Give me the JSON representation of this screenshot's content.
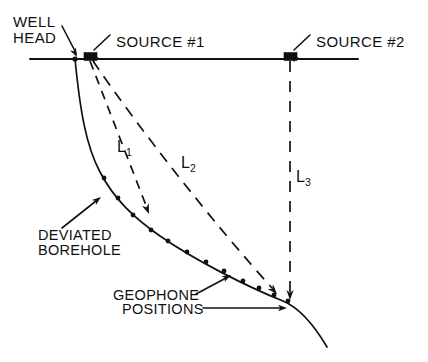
{
  "figure": {
    "background_color": "#ffffff",
    "line_color": "#111111",
    "labels": {
      "well_head_line1": "WELL",
      "well_head_line2": "HEAD",
      "source_1": "SOURCE #1",
      "source_2": "SOURCE #2",
      "deviated_line1": "DEVIATED",
      "deviated_line2": "BOREHOLE",
      "geophone_line1": "GEOPHONE",
      "geophone_line2": "POSITIONS"
    },
    "ray_labels": [
      {
        "base": "L",
        "sub": "1"
      },
      {
        "base": "L",
        "sub": "2"
      },
      {
        "base": "L",
        "sub": "3"
      }
    ],
    "surface": {
      "name": "ground-surface-line",
      "x1": 30,
      "y1": 59,
      "x2": 358,
      "y2": 59
    },
    "well_head_marker": {
      "x": 75,
      "y": 59,
      "r": 2.6
    },
    "sources": [
      {
        "name": "source-1",
        "x": 84,
        "y": 52.5,
        "w": 13,
        "h": 8
      },
      {
        "name": "source-2",
        "x": 284,
        "y": 52.5,
        "w": 13,
        "h": 8
      }
    ],
    "borehole_path": "M 75,59 C 80,110 86,146 100,172 C 114,199 134,218 160,236 C 196,261 248,287 283,301 C 300,308 314,325 327,347",
    "geophones": [
      {
        "x": 104,
        "y": 178
      },
      {
        "x": 118,
        "y": 198
      },
      {
        "x": 133,
        "y": 215
      },
      {
        "x": 151,
        "y": 230
      },
      {
        "x": 168,
        "y": 241
      },
      {
        "x": 187,
        "y": 252
      },
      {
        "x": 206,
        "y": 262
      },
      {
        "x": 224,
        "y": 271
      },
      {
        "x": 243,
        "y": 281
      },
      {
        "x": 259,
        "y": 288
      },
      {
        "x": 274,
        "y": 295
      },
      {
        "x": 288,
        "y": 301
      }
    ],
    "rays": [
      {
        "name": "ray-l1",
        "path": "M 90,61 L 147,208",
        "dash": "9 7",
        "arrow_at": {
          "x": 149,
          "y": 214,
          "angle": 69
        },
        "label_pos": {
          "x": 117,
          "y": 152
        }
      },
      {
        "name": "ray-l2",
        "path": "M 93,61 C 140,130 215,225 272,288",
        "dash": "11 8",
        "arrow_at": {
          "x": 277,
          "y": 294,
          "angle": 48
        },
        "label_pos": {
          "x": 181,
          "y": 168
        }
      },
      {
        "name": "ray-l3",
        "path": "M 290,61 L 290,292",
        "dash": "11 9",
        "arrow_at": {
          "x": 290,
          "y": 300,
          "angle": 90
        },
        "label_pos": {
          "x": 296,
          "y": 182
        }
      }
    ],
    "leaders": [
      {
        "name": "well-head-leader",
        "path": "M 62,26 L 76,53",
        "arrow": {
          "x": 77,
          "y": 57,
          "angle": 63
        }
      },
      {
        "name": "source-1-leader",
        "path": "M 110,35 L 94,50",
        "arrow": {
          "x": 90,
          "y": 54,
          "angle": 223
        }
      },
      {
        "name": "source-2-leader",
        "path": "M 310,35 L 294,50",
        "arrow": {
          "x": 290,
          "y": 54,
          "angle": 223
        }
      },
      {
        "name": "deviated-borehole-leader",
        "path": "M 62,228 L 96,201",
        "arrow": {
          "x": 101,
          "y": 197,
          "angle": -38
        }
      },
      {
        "name": "geophone-leader-upper",
        "path": "M 196,294 L 226,278",
        "arrow": {
          "x": 231,
          "y": 275,
          "angle": -28
        }
      },
      {
        "name": "geophone-leader-lower",
        "path": "M 203,308 L 281,308",
        "arrow": {
          "x": 287,
          "y": 308,
          "angle": 0
        }
      }
    ]
  }
}
